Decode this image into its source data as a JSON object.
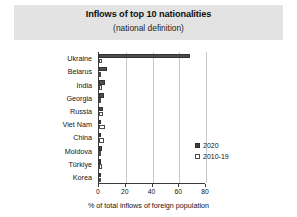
{
  "title_band": {
    "title": "Inflows of top 10 nationalities",
    "subtitle": "(national definition)"
  },
  "legend": {
    "position": "inside-right",
    "entries": [
      {
        "label": "2020",
        "swatch": "filled-dark-square"
      },
      {
        "label": "2010-19",
        "swatch": "outlined-white-square"
      }
    ]
  },
  "axis": {
    "xlabel": "% of total inflows of foreign population",
    "ticks": [
      "0",
      "20",
      "40",
      "60",
      "80"
    ]
  },
  "colors": {
    "band": "#e3e3e3",
    "series_2020": "#4d4d4d",
    "series_2010_19": "#ffffff",
    "outline": "#3a3a3a",
    "gridline": "#c9c9c9"
  },
  "chart_data": {
    "type": "bar",
    "orientation": "horizontal",
    "title": "Inflows of top 10 nationalities",
    "subtitle": "(national definition)",
    "xlabel": "% of total inflows of foreign population",
    "ylabel": "",
    "xlim": [
      0,
      80
    ],
    "xticks": [
      0,
      20,
      40,
      60,
      80
    ],
    "grid": "vertical",
    "legend_position": "inside-right",
    "categories": [
      "Ukraine",
      "Belarus",
      "India",
      "Georgia",
      "Russia",
      "Viet Nam",
      "China",
      "Moldova",
      "Türkiye",
      "Korea"
    ],
    "series": [
      {
        "name": "2020",
        "values": [
          68.0,
          6.0,
          4.2,
          4.0,
          3.0,
          1.6,
          1.5,
          2.0,
          1.5,
          1.0
        ]
      },
      {
        "name": "2010-19",
        "values": [
          2.0,
          1.6,
          2.0,
          1.5,
          3.0,
          4.2,
          3.6,
          1.0,
          2.0,
          1.5
        ]
      }
    ]
  }
}
